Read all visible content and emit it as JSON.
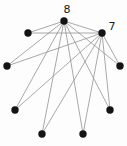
{
  "figure": {
    "width": 127,
    "height": 146,
    "background": "#fdfdfd",
    "node_color": "#141414",
    "edge_color": "#8c8c8c",
    "edge_width": 0.75,
    "label_color": "#1a1a1a",
    "node_radius": 3.7,
    "nodes": [
      {
        "id": "hub-8",
        "x": 64,
        "y": 21,
        "label": "8",
        "label_x": 67,
        "label_y": 13
      },
      {
        "id": "hub-7",
        "x": 102,
        "y": 33,
        "label": "7",
        "label_x": 112,
        "label_y": 30
      },
      {
        "id": "node-upper-left",
        "x": 28,
        "y": 33,
        "label": ""
      },
      {
        "id": "node-left",
        "x": 7,
        "y": 66,
        "label": ""
      },
      {
        "id": "node-lower-left",
        "x": 15,
        "y": 110,
        "label": ""
      },
      {
        "id": "node-bottom-left",
        "x": 42,
        "y": 134,
        "label": ""
      },
      {
        "id": "node-bottom-right",
        "x": 83,
        "y": 134,
        "label": ""
      },
      {
        "id": "node-lower-right",
        "x": 110,
        "y": 110,
        "label": ""
      },
      {
        "id": "node-right",
        "x": 120,
        "y": 66,
        "label": ""
      }
    ],
    "edges": [
      [
        "hub-8",
        "hub-7"
      ],
      [
        "hub-8",
        "node-upper-left"
      ],
      [
        "hub-8",
        "node-left"
      ],
      [
        "hub-8",
        "node-lower-left"
      ],
      [
        "hub-8",
        "node-bottom-left"
      ],
      [
        "hub-8",
        "node-bottom-right"
      ],
      [
        "hub-8",
        "node-lower-right"
      ],
      [
        "hub-8",
        "node-right"
      ],
      [
        "hub-7",
        "node-upper-left"
      ],
      [
        "hub-7",
        "node-left"
      ],
      [
        "hub-7",
        "node-lower-left"
      ],
      [
        "hub-7",
        "node-bottom-left"
      ],
      [
        "hub-7",
        "node-bottom-right"
      ],
      [
        "hub-7",
        "node-lower-right"
      ],
      [
        "hub-7",
        "node-right"
      ]
    ]
  },
  "chart_data": {
    "type": "scatter",
    "title": "",
    "node_count": 9,
    "edge_count": 15,
    "labeled_nodes": [
      {
        "label": "8",
        "degree": 8
      },
      {
        "label": "7",
        "degree": 7
      }
    ]
  }
}
